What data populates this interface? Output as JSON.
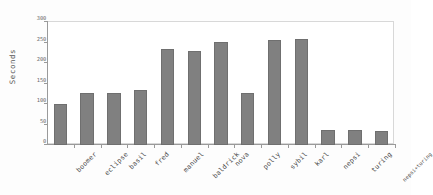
{
  "chart_data": {
    "type": "bar",
    "title": "",
    "xlabel": "",
    "ylabel": "Seconds",
    "ylim": [
      0,
      300
    ],
    "yticks": [
      0,
      50,
      100,
      150,
      200,
      250,
      300
    ],
    "ytick_labels": [
      "0",
      "50",
      "100",
      "150",
      "200",
      "250",
      "300"
    ],
    "grid": false,
    "legend": false,
    "bar_color": "#808080",
    "background_color": "#ffffff",
    "categories": [
      "boomer",
      "eclipse",
      "basil",
      "fred",
      "manuel",
      "baldrick",
      "nova",
      "polly",
      "sybil",
      "karl",
      "nepsi",
      "turing",
      "nepsi+turing"
    ],
    "values": [
      99,
      128,
      126,
      134,
      233,
      230,
      252,
      126,
      256,
      259,
      36,
      36,
      35
    ]
  }
}
